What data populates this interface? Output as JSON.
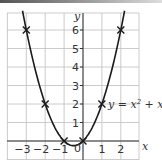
{
  "chart_data": {
    "type": "line",
    "title": "",
    "equation_label": "y = x² + x",
    "equation_parts": {
      "lhs": "y = x",
      "exp": "2",
      "rhs": " + x"
    },
    "xlabel": "x",
    "ylabel": "y",
    "xlim": [
      -4,
      3
    ],
    "ylim": [
      -1,
      7
    ],
    "grid": true,
    "x_ticks": [
      "-3",
      "-2",
      "-1",
      "1",
      "2"
    ],
    "x_tick_values": [
      -3,
      -2,
      -1,
      1,
      2
    ],
    "y_ticks": [
      "1",
      "2",
      "3",
      "4",
      "5",
      "6"
    ],
    "y_tick_values": [
      1,
      2,
      3,
      4,
      5,
      6
    ],
    "origin_label": "0",
    "series": [
      {
        "name": "y = x^2 + x",
        "marker": "x",
        "points": [
          {
            "x": -3,
            "y": 6
          },
          {
            "x": -2,
            "y": 2
          },
          {
            "x": -1,
            "y": 0
          },
          {
            "x": 0,
            "y": 0
          },
          {
            "x": 1,
            "y": 2
          },
          {
            "x": 2,
            "y": 6
          }
        ]
      }
    ],
    "colors": {
      "curve": "#1a1a1a",
      "grid": "#bfbfbf",
      "axis": "#333333",
      "text": "#333333"
    }
  }
}
